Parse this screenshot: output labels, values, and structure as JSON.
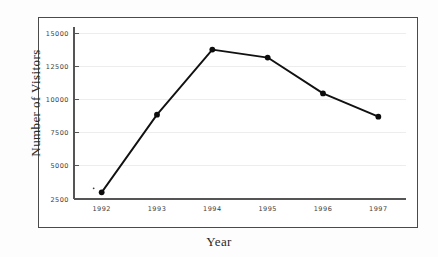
{
  "chart_data": {
    "type": "line",
    "title": "",
    "xlabel": "Year",
    "ylabel": "Number of Visitors",
    "categories": [
      "1992",
      "1993",
      "1994",
      "1995",
      "1996",
      "1997"
    ],
    "values": [
      3000,
      8850,
      13750,
      13150,
      10450,
      8700
    ],
    "series": [
      {
        "name": "Number of Visitors",
        "values": [
          3000,
          8850,
          13750,
          13150,
          10450,
          8700
        ]
      }
    ],
    "ylim": [
      2500,
      15000
    ],
    "yticks": [
      2500,
      5000,
      7500,
      10000,
      12500,
      15000
    ],
    "ytick_labels": [
      "2500",
      "5000",
      "7500",
      "10000",
      "12500",
      "15000"
    ],
    "xtick_labels": [
      "1992",
      "1993",
      "1994",
      "1995",
      "1996",
      "1997"
    ],
    "grid": true,
    "grid_axis": "y",
    "legend": false,
    "legend_position": "none",
    "marker": "filled-circle",
    "line_color": "#111111",
    "marker_color": "#0d0d0d",
    "grid_color": "#ededed",
    "axis_color": "#555555",
    "frame_color": "#4a4a4a",
    "background_color": "#ffffff"
  }
}
